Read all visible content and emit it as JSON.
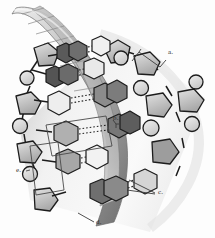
{
  "figure": {
    "background_color": "#fdfdfd",
    "width": 215,
    "height": 238
  },
  "labels": [
    {
      "id": "a",
      "text": "a.",
      "x": 168,
      "y": 52,
      "callout": "bracket",
      "refers_to": "sugar-phosphate-backbone-segment"
    },
    {
      "id": "b",
      "text": "b.",
      "x": 113,
      "y": 122,
      "callout": "leader-line",
      "refers_to": "nitrogenous-base-purine"
    },
    {
      "id": "c",
      "text": "c.",
      "x": 158,
      "y": 192,
      "callout": "double-leader-line",
      "refers_to": "hydrogen-bonds"
    },
    {
      "id": "d",
      "text": "d.",
      "x": 96,
      "y": 223,
      "callout": "leader-line",
      "refers_to": "deoxyribose-sugar"
    },
    {
      "id": "e",
      "text": "e.",
      "x": 20,
      "y": 171,
      "callout": "bracket-box",
      "refers_to": "nucleotide-unit"
    }
  ],
  "palette": {
    "base_dark": "#4f4f4f",
    "base_mid": "#7d7d7d",
    "base_light": "#d7d7d7",
    "base_pale": "#f2f2f2",
    "sugar": "#b9b9b9",
    "sugar_light": "#dedede",
    "phosphate": "#d2d2d2",
    "ribbon_dark": "#6e6e6e",
    "ribbon_mid": "#a0a0a0",
    "ribbon_light": "#e6e6e6",
    "outline": "#1c1c1c",
    "label_text": "#2b2b2b"
  },
  "components": {
    "phosphate_name": "phosphate-circle",
    "sugar_name": "deoxyribose-pentagon",
    "base_purine_name": "purine-base-double-ring",
    "base_pyrimidine_name": "pyrimidine-base-hexagon",
    "hbond_name": "hydrogen-bond-dotted-line",
    "ribbon_name": "helix-ribbon",
    "rung_name": "helix-rung"
  }
}
